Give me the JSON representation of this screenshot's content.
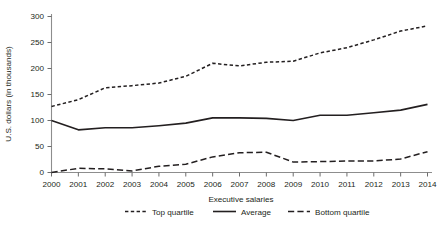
{
  "chart_data": {
    "type": "line",
    "title": "",
    "xlabel": "Executive salaries",
    "ylabel": "U.S. dollars (in thousands)",
    "x": [
      2000,
      2001,
      2002,
      2003,
      2004,
      2005,
      2006,
      2007,
      2008,
      2009,
      2010,
      2011,
      2012,
      2013,
      2014
    ],
    "categories": [
      "2000",
      "2001",
      "2002",
      "2003",
      "2004",
      "2005",
      "2006",
      "2007",
      "2008",
      "2009",
      "2010",
      "2011",
      "2012",
      "2013",
      "2014"
    ],
    "xlim": [
      2000,
      2014
    ],
    "ylim": [
      0,
      300
    ],
    "yticks": [
      0,
      50,
      100,
      150,
      200,
      250,
      300
    ],
    "ytick_labels": [
      "0",
      "50",
      "100",
      "150",
      "200",
      "250",
      "300"
    ],
    "xticks": [
      2000,
      2001,
      2002,
      2003,
      2004,
      2005,
      2006,
      2007,
      2008,
      2009,
      2010,
      2011,
      2012,
      2013,
      2014
    ],
    "xtick_labels": [
      "2000",
      "2001",
      "2002",
      "2003",
      "2004",
      "2005",
      "2006",
      "2007",
      "2008",
      "2009",
      "2010",
      "2011",
      "2012",
      "2013",
      "2014"
    ],
    "grid": false,
    "legend_position": "bottom",
    "series": [
      {
        "name": "Top quartile",
        "style": "dashed-short",
        "values": [
          127,
          140,
          163,
          167,
          172,
          185,
          210,
          205,
          212,
          214,
          230,
          240,
          255,
          272,
          282
        ]
      },
      {
        "name": "Average",
        "style": "solid",
        "values": [
          100,
          82,
          86,
          86,
          90,
          95,
          105,
          105,
          104,
          100,
          110,
          110,
          115,
          120,
          131
        ]
      },
      {
        "name": "Bottom quartile",
        "style": "dashed-long",
        "values": [
          0,
          8,
          7,
          3,
          12,
          16,
          30,
          38,
          39,
          20,
          21,
          22,
          22,
          26,
          40
        ]
      }
    ]
  },
  "legend": {
    "items": [
      {
        "label": "Top quartile"
      },
      {
        "label": "Average"
      },
      {
        "label": "Bottom quartile"
      }
    ]
  },
  "colors": {
    "ink": "#231f20",
    "axis": "#8d8d8d",
    "background": "#ffffff"
  }
}
